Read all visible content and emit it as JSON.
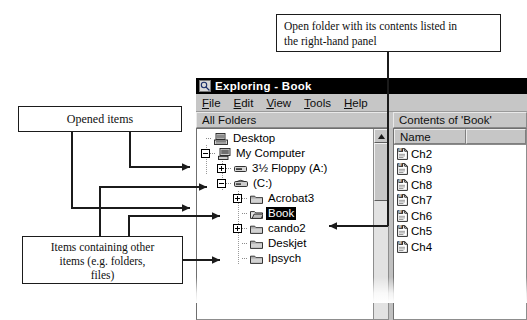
{
  "annotations": {
    "top": {
      "line1": "Open folder with its contents listed in",
      "line2": "the right-hand panel"
    },
    "opened_items": {
      "label": "Opened  items"
    },
    "containing_items": {
      "line1": "Items containing other",
      "line2": "items (e.g. folders,",
      "line3": "files)"
    }
  },
  "window": {
    "title": "Exploring - Book",
    "icon": "magnifier-folder-icon",
    "menu": [
      {
        "label": "File",
        "accel": "F"
      },
      {
        "label": "Edit",
        "accel": "E"
      },
      {
        "label": "View",
        "accel": "V"
      },
      {
        "label": "Tools",
        "accel": "T"
      },
      {
        "label": "Help",
        "accel": "H"
      }
    ],
    "panes": {
      "left_header": "All Folders",
      "right_header": "Contents of 'Book'"
    },
    "tree": [
      {
        "label": "Desktop",
        "level": 0,
        "toggle": "none",
        "icon": "desktop-icon",
        "selected": false
      },
      {
        "label": "My Computer",
        "level": 1,
        "toggle": "minus",
        "icon": "computer-icon",
        "selected": false
      },
      {
        "label": "3½ Floppy (A:)",
        "level": 2,
        "toggle": "plus",
        "icon": "floppy-drive-icon",
        "selected": false
      },
      {
        "label": "(C:)",
        "level": 2,
        "toggle": "minus",
        "icon": "hard-drive-icon",
        "selected": false
      },
      {
        "label": "Acrobat3",
        "level": 3,
        "toggle": "plus",
        "icon": "folder-closed-icon",
        "selected": false
      },
      {
        "label": "Book",
        "level": 3,
        "toggle": "none",
        "icon": "folder-open-icon",
        "selected": true
      },
      {
        "label": "cando2",
        "level": 3,
        "toggle": "plus",
        "icon": "folder-closed-icon",
        "selected": false
      },
      {
        "label": "Deskjet",
        "level": 3,
        "toggle": "none",
        "icon": "folder-closed-icon",
        "selected": false
      },
      {
        "label": "Ipsych",
        "level": 3,
        "toggle": "none",
        "icon": "folder-closed-icon",
        "selected": false
      }
    ],
    "contents": {
      "columns": [
        "Name",
        ""
      ],
      "files": [
        {
          "name": "Ch2",
          "icon": "word-document-icon"
        },
        {
          "name": "Ch9",
          "icon": "word-document-icon"
        },
        {
          "name": "Ch8",
          "icon": "word-document-icon"
        },
        {
          "name": "Ch7",
          "icon": "word-document-icon"
        },
        {
          "name": "Ch6",
          "icon": "word-document-icon"
        },
        {
          "name": "Ch5",
          "icon": "word-document-icon"
        },
        {
          "name": "Ch4",
          "icon": "word-document-icon"
        }
      ]
    },
    "scrollbar": {
      "up_arrow": "▲"
    }
  },
  "colors": {
    "window_face": "#c0c0c0",
    "titlebar_bg": "#000000",
    "titlebar_fg": "#ffffff",
    "selection_bg": "#000000",
    "selection_fg": "#ffffff",
    "pane_bg": "#ffffff",
    "annotation_line": "#1b1b1b"
  }
}
